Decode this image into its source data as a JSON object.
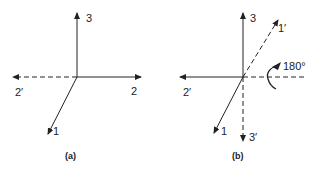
{
  "figure": {
    "panels": [
      {
        "id": "a",
        "caption": "(a)",
        "axes": [
          {
            "label": "3",
            "style": "solid",
            "direction": "up"
          },
          {
            "label": "2",
            "style": "solid",
            "direction": "right"
          },
          {
            "label": "2′",
            "style": "dashed",
            "direction": "left"
          },
          {
            "label": "1",
            "style": "solid",
            "direction": "down-left"
          }
        ]
      },
      {
        "id": "b",
        "caption": "(b)",
        "axes": [
          {
            "label": "3",
            "style": "solid",
            "direction": "up"
          },
          {
            "label": "1′",
            "style": "dashed",
            "direction": "up-right"
          },
          {
            "label": "2′",
            "style": "solid",
            "direction": "left"
          },
          {
            "label": "1",
            "style": "solid",
            "direction": "down-left"
          },
          {
            "label": "3′",
            "style": "dashed",
            "direction": "down"
          }
        ],
        "rotation": {
          "label": "180°",
          "axis": "dashed horizontal (right)"
        }
      }
    ],
    "colors": {
      "line": "#222222",
      "background": "#ffffff"
    }
  }
}
